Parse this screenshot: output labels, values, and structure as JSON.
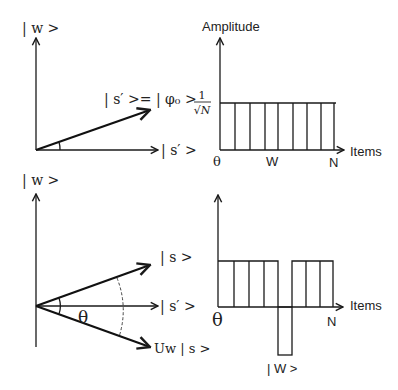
{
  "panels": {
    "top_left": {
      "y_axis_label": "| w >",
      "vector_label": "| s′ >= | φ₀ >",
      "x_axis_label": "| s′ >"
    },
    "top_right": {
      "y_axis_label": "Amplitude",
      "level_label_num": "1",
      "level_label_den": "√N",
      "x_axis_label": "Items",
      "tick_start": "θ",
      "tick_mid": "W",
      "tick_end": "N",
      "bars": 8
    },
    "bottom_left": {
      "y_axis_label": "| w >",
      "vector_s_label": "| s >",
      "vector_sprime_label": "| s′ >",
      "vector_uw_label": "Uw | s >",
      "angle_label": "θ"
    },
    "bottom_right": {
      "x_axis_label": "Items",
      "tick_start": "θ",
      "tick_end": "N",
      "marked_item_label": "| W >",
      "bars_positive_left": 4,
      "bars_negative": 1,
      "bars_positive_right": 3
    }
  }
}
